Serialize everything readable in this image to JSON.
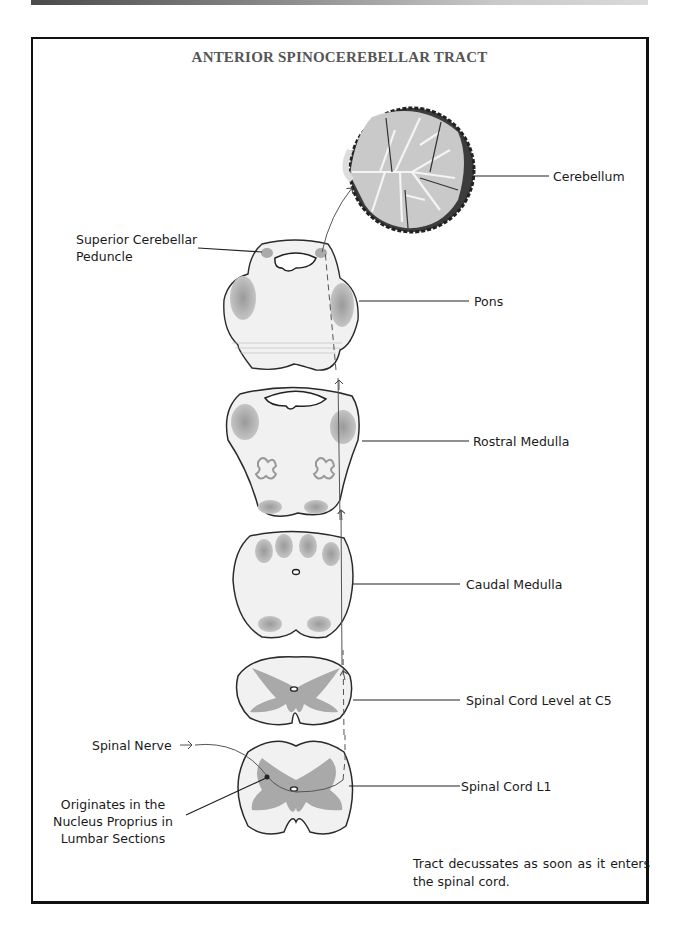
{
  "header": {
    "bar_colors": [
      "#4a4a4a",
      "#dadada"
    ]
  },
  "figure": {
    "title": "ANTERIOR SPINOCEREBELLAR TRACT",
    "labels": {
      "cerebellum": "Cerebellum",
      "superior_cerebellar_peduncle_line1": "Superior   Cerebellar",
      "superior_cerebellar_peduncle_line2": "Peduncle",
      "pons": "Pons",
      "rostral_medulla": "Rostral Medulla",
      "caudal_medulla": "Caudal Medulla",
      "spinal_cord_c5": "Spinal Cord Level at C5",
      "spinal_nerve": "Spinal Nerve",
      "spinal_cord_l1": "Spinal Cord L1",
      "origin_line1": "Originates in the",
      "origin_line2": "Nucleus Proprius in",
      "origin_line3": "Lumbar Sections"
    },
    "note": "Tract decussates as soon as it enters the spinal cord.",
    "sections": [
      "Cerebellum",
      "Pons",
      "Rostral Medulla",
      "Caudal Medulla",
      "Spinal Cord Level at C5",
      "Spinal Cord L1"
    ],
    "colors": {
      "outline": "#2a2a2a",
      "tissue": "#f2f2f2",
      "gray_matter": "#a9a9a9",
      "folia": "#3a3a3a"
    }
  }
}
